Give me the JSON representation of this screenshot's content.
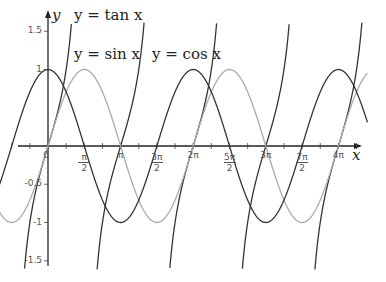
{
  "chart_data": {
    "type": "line",
    "title": "",
    "xlabel": "x",
    "ylabel": "y",
    "xlim": [
      -0.9,
      4.35
    ],
    "ylim": [
      -1.6,
      1.6
    ],
    "x_units": "pi",
    "grid": false,
    "legend_position": "inline annotations",
    "x_tick_labels": [
      "0",
      "π/2",
      "π",
      "3π/2",
      "2π",
      "5π/2",
      "3π",
      "7π/2",
      "4π"
    ],
    "x_ticks": [
      0,
      0.5,
      1,
      1.5,
      2,
      2.5,
      3,
      3.5,
      4
    ],
    "y_tick_labels": [
      "1.5",
      "1",
      "-0.5",
      "-1",
      "-1.5"
    ],
    "y_ticks": [
      1.5,
      1,
      -0.5,
      -1,
      -1.5
    ],
    "series": [
      {
        "name": "y = tan x",
        "function": "tan",
        "color": "#333333"
      },
      {
        "name": "y = sin x",
        "function": "sin",
        "color": "#aaaaaa"
      },
      {
        "name": "y = cos x",
        "function": "cos",
        "color": "#333333"
      }
    ],
    "annotations": [
      {
        "text": "y = tan x",
        "x": 74,
        "y": 14
      },
      {
        "text": "y = sin x",
        "x": 74,
        "y": 53
      },
      {
        "text": "y = cos x",
        "x": 152,
        "y": 53
      }
    ]
  },
  "labels": {
    "tan": "y = tan x",
    "sin": "y = sin x",
    "cos": "y = cos x",
    "x_axis": "x",
    "y_axis": "y",
    "origin": "0"
  }
}
